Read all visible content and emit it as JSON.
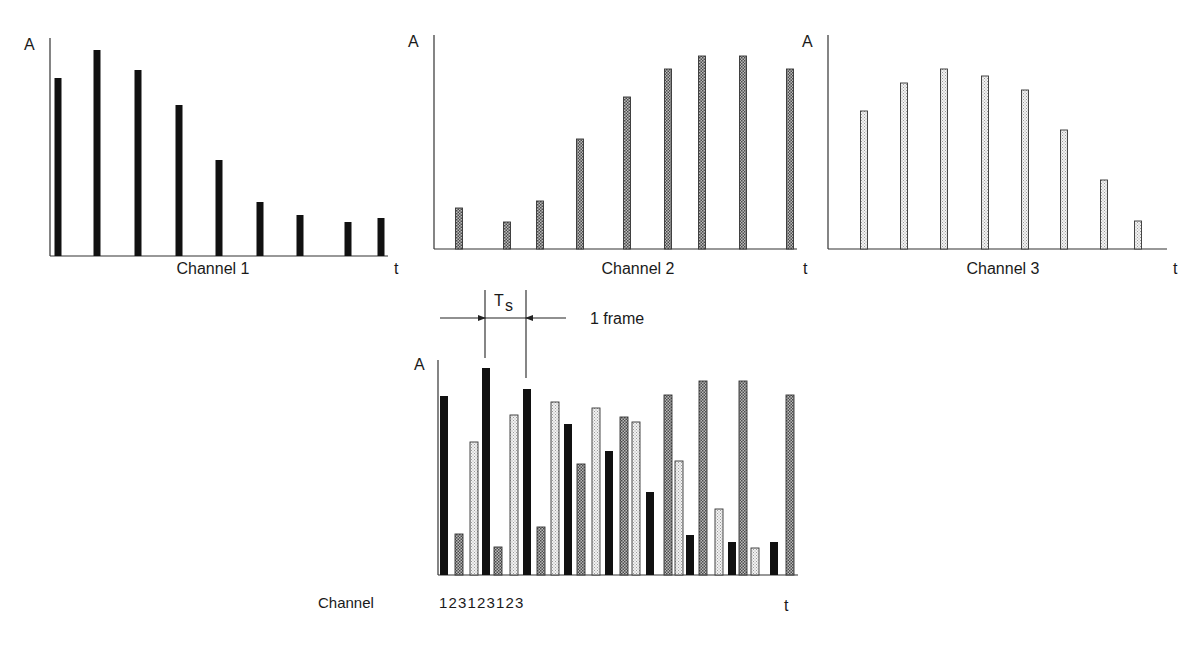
{
  "styles": {
    "ch1": {
      "fill": "#111111",
      "stroke": "#111111",
      "pattern": "solid"
    },
    "ch2": {
      "fill": "#8a8a8a",
      "stroke": "#333333",
      "pattern": "dense-dots"
    },
    "ch3": {
      "fill": "#dcdcdc",
      "stroke": "#333333",
      "pattern": "light-dots"
    },
    "axis_color": "#333333"
  },
  "labels": {
    "y_axis": "A",
    "x_axis": "t",
    "ts_main": "T",
    "ts_sub": "s",
    "frame": "1 frame",
    "channel_row": "Channel",
    "channel_sequence": "1 2 3 1 2 3 1 2 3"
  },
  "chart_data": [
    {
      "type": "bar",
      "title": "Channel 1",
      "xlabel": "t",
      "ylabel": "A",
      "channel": 1,
      "axis": {
        "x0": 50,
        "y0": 256,
        "x1": 388,
        "ytop": 38
      },
      "label_pos": {
        "x": 213,
        "y": 274
      },
      "bar_width": 7,
      "x": [
        58,
        97,
        138,
        179,
        219,
        260,
        300,
        348,
        381
      ],
      "values": [
        178,
        206,
        186,
        151,
        96,
        54,
        41,
        34,
        38
      ]
    },
    {
      "type": "bar",
      "title": "Channel 2",
      "xlabel": "t",
      "ylabel": "A",
      "channel": 2,
      "axis": {
        "x0": 434,
        "y0": 249,
        "x1": 797,
        "ytop": 35
      },
      "label_pos": {
        "x": 638,
        "y": 274
      },
      "bar_width": 7,
      "x": [
        459,
        507,
        540,
        580,
        627,
        668,
        702,
        743,
        790
      ],
      "values": [
        41,
        27,
        48,
        110,
        152,
        180,
        193,
        193,
        180
      ]
    },
    {
      "type": "bar",
      "title": "Channel 3",
      "xlabel": "t",
      "ylabel": "A",
      "channel": 3,
      "axis": {
        "x0": 828,
        "y0": 249,
        "x1": 1167,
        "ytop": 35
      },
      "label_pos": {
        "x": 1003,
        "y": 274
      },
      "bar_width": 7,
      "x": [
        864,
        904,
        944,
        985,
        1025,
        1064,
        1104,
        1138
      ],
      "values": [
        138,
        166,
        180,
        173,
        159,
        119,
        69,
        28
      ]
    },
    {
      "type": "bar",
      "title": "Multiplexed signal",
      "xlabel": "t",
      "ylabel": "A",
      "axis": {
        "x0": 438,
        "y0": 575,
        "x1": 798,
        "ytop": 360
      },
      "bar_width": 8,
      "bars": [
        {
          "ch": 1,
          "x": 444,
          "value": 179
        },
        {
          "ch": 2,
          "x": 459,
          "value": 41
        },
        {
          "ch": 3,
          "x": 474,
          "value": 133
        },
        {
          "ch": 1,
          "x": 486,
          "value": 207
        },
        {
          "ch": 2,
          "x": 498,
          "value": 28
        },
        {
          "ch": 3,
          "x": 514,
          "value": 160
        },
        {
          "ch": 1,
          "x": 527,
          "value": 186
        },
        {
          "ch": 2,
          "x": 541,
          "value": 48
        },
        {
          "ch": 3,
          "x": 555,
          "value": 173
        },
        {
          "ch": 1,
          "x": 568,
          "value": 151
        },
        {
          "ch": 2,
          "x": 581,
          "value": 111
        },
        {
          "ch": 3,
          "x": 596,
          "value": 167
        },
        {
          "ch": 1,
          "x": 609,
          "value": 124
        },
        {
          "ch": 2,
          "x": 624,
          "value": 158
        },
        {
          "ch": 3,
          "x": 636,
          "value": 153
        },
        {
          "ch": 1,
          "x": 650,
          "value": 83
        },
        {
          "ch": 2,
          "x": 668,
          "value": 180
        },
        {
          "ch": 3,
          "x": 679,
          "value": 114
        },
        {
          "ch": 1,
          "x": 690,
          "value": 40
        },
        {
          "ch": 2,
          "x": 703,
          "value": 194
        },
        {
          "ch": 3,
          "x": 719,
          "value": 66
        },
        {
          "ch": 1,
          "x": 732,
          "value": 33
        },
        {
          "ch": 2,
          "x": 743,
          "value": 194
        },
        {
          "ch": 3,
          "x": 755,
          "value": 27
        },
        {
          "ch": 1,
          "x": 774,
          "value": 33
        },
        {
          "ch": 2,
          "x": 790,
          "value": 180
        }
      ],
      "annotation": {
        "ts_line_left_x": 485,
        "ts_line_right_x": 526,
        "ts_line_top": 290,
        "ts_left_bottom": 358,
        "ts_right_bottom": 378,
        "arrow_y": 318,
        "arrow_left_start": 440,
        "arrow_right_start": 566
      }
    }
  ]
}
